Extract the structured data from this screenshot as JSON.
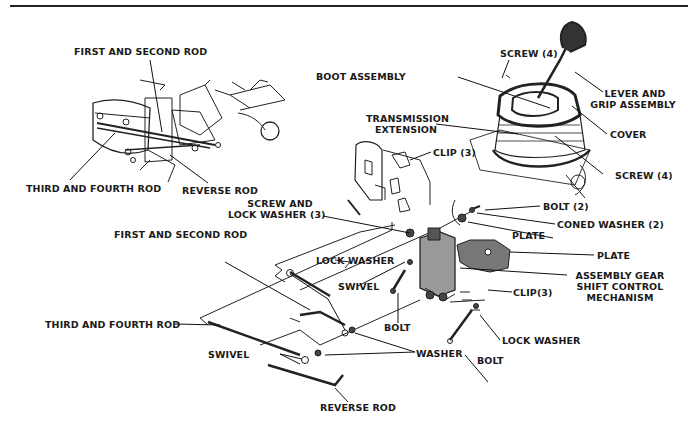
{
  "figure": {
    "type": "exploded-parts-diagram",
    "inset_labels": [
      {
        "id": "inset_first_second_rod",
        "text": "FIRST AND SECOND ROD"
      },
      {
        "id": "inset_third_fourth_rod",
        "text": "THIRD AND FOURTH ROD"
      },
      {
        "id": "inset_reverse_rod",
        "text": "REVERSE ROD"
      }
    ],
    "labels": {
      "screw_top": "SCREW (4)",
      "boot_assembly": "BOOT ASSEMBLY",
      "lever_grip_1": "LEVER AND",
      "lever_grip_2": "GRIP ASSEMBLY",
      "transmission_ext_1": "TRANSMISSION",
      "transmission_ext_2": "EXTENSION",
      "cover": "COVER",
      "clip_top": "CLIP (3)",
      "screw_right": "SCREW (4)",
      "screw_lock_1": "SCREW  AND",
      "screw_lock_2": "LOCK WASHER (3)",
      "bolt_2": "BOLT (2)",
      "coned_washer": "CONED WASHER (2)",
      "first_second_rod": "FIRST AND SECOND ROD",
      "plate_1": "PLATE",
      "plate_2": "PLATE",
      "lock_washer_mid": "LOCK WASHER",
      "assembly_1": "ASSEMBLY  GEAR",
      "assembly_2": "SHIFT  CONTROL",
      "assembly_3": "MECHANISM",
      "swivel_mid": "SWIVEL",
      "clip_bottom": "CLIP(3)",
      "third_fourth_rod": "THIRD AND FOURTH ROD",
      "bolt_mid": "BOLT",
      "lock_washer_low": "LOCK WASHER",
      "swivel_low": "SWIVEL",
      "washer": "WASHER",
      "bolt_low": "BOLT",
      "reverse_rod": "REVERSE ROD"
    }
  }
}
